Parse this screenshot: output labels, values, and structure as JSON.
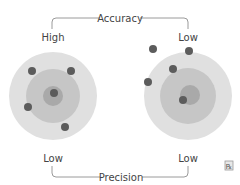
{
  "top_bracket": {
    "label": "Accuracy"
  },
  "bottom_bracket": {
    "label": "Precision"
  },
  "left_target": {
    "top_label": "High",
    "bottom_label": "Low"
  },
  "right_target": {
    "top_label": "Low",
    "bottom_label": "Low"
  },
  "corner_icon": "rx-icon",
  "colors": {
    "outer_ring": "#e0e0e0",
    "middle_ring": "#c6c6c6",
    "inner_ring": "#a9a9a9",
    "dot": "#5c5c5c",
    "line": "#9a9a9a",
    "text": "#444444"
  }
}
